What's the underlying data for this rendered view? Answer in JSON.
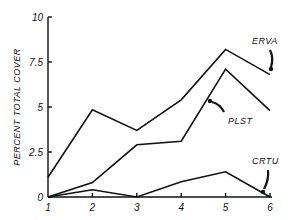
{
  "chart_data": {
    "type": "line",
    "title": "",
    "xlabel": "",
    "ylabel": "PERCENT TOTAL COVER",
    "x": [
      1,
      2,
      3,
      4,
      5,
      6
    ],
    "x_tick_labels": [
      "1",
      "2",
      "3",
      "4",
      "5",
      "6"
    ],
    "y_tick_labels": [
      "0",
      "2.5",
      "5",
      "7.5",
      "10"
    ],
    "y_ticks": [
      0,
      2.5,
      5,
      7.5,
      10
    ],
    "ylim": [
      0,
      10
    ],
    "xlim": [
      1,
      6
    ],
    "grid": false,
    "legend": "inline labels with arrows",
    "series": [
      {
        "name": "ERVA",
        "values": [
          1.1,
          4.85,
          3.7,
          5.4,
          8.2,
          6.8
        ]
      },
      {
        "name": "PLST",
        "values": [
          0.0,
          0.8,
          2.9,
          3.1,
          7.1,
          4.8
        ]
      },
      {
        "name": "CRTU",
        "values": [
          0.0,
          0.4,
          0.0,
          0.85,
          1.4,
          0.0
        ]
      }
    ],
    "annotations": [
      {
        "text": "ERVA",
        "arrow_to": [
          6,
          6.8
        ]
      },
      {
        "text": "PLST",
        "arrow_to": [
          5,
          6.2
        ]
      },
      {
        "text": "CRTU",
        "arrow_to": [
          6,
          0.0
        ]
      }
    ]
  }
}
